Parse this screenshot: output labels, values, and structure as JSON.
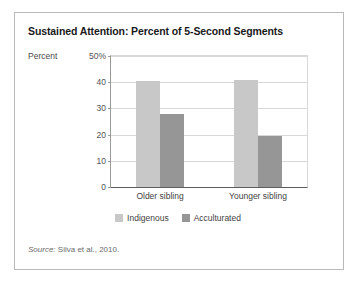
{
  "figure": {
    "title": "Sustained Attention: Percent of 5-Second Segments",
    "source_prefix": "Source:",
    "source_text": "Silva et al., 2010."
  },
  "colors": {
    "indigenous": "#c8c8c8",
    "acculturated": "#969696",
    "frame_border": "#b9b9b9",
    "gridline": "#d8d8d8",
    "axis": "#5d5d5d",
    "title_text": "#1a1a1a",
    "tick_text": "#545454"
  },
  "chart_data": {
    "type": "bar",
    "title": "Sustained Attention: Percent of 5-Second Segments",
    "xlabel": "",
    "ylabel": "Percent",
    "ylim": [
      0,
      50
    ],
    "yticks": [
      0,
      10,
      20,
      30,
      40,
      50
    ],
    "ytick_labels": [
      "0",
      "10",
      "20",
      "30",
      "40",
      "50%"
    ],
    "grid": true,
    "legend_position": "bottom-center",
    "categories": [
      "Older sibling",
      "Younger sibling"
    ],
    "series": [
      {
        "name": "Indigenous",
        "color": "#c8c8c8",
        "values": [
          40.5,
          40.7
        ]
      },
      {
        "name": "Acculturated",
        "color": "#969696",
        "values": [
          28.0,
          19.3
        ]
      }
    ],
    "annotations": []
  }
}
